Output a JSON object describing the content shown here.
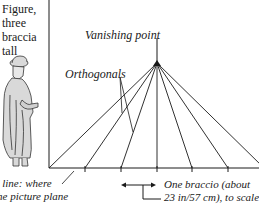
{
  "diagram": {
    "figure_label": [
      "Figure,",
      "three",
      "braccia",
      "tall"
    ],
    "vanishing_point_label": "Vanishing point",
    "orthogonals_label": "Orthogonals",
    "ground_line_label": [
      "d line: where",
      "the picture plane",
      ""
    ],
    "braccio_label": [
      "One braccio (about",
      "23 in/57 cm), to scale"
    ],
    "colors": {
      "line": "#1a1a1a",
      "figure_fill": "#d9d9d9",
      "figure_stroke": "#333333",
      "background": "#ffffff"
    }
  }
}
